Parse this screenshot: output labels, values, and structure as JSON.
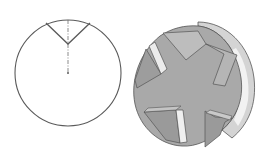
{
  "figure": {
    "colors": {
      "background": "#ffffff",
      "line": "#5a5a5a",
      "face": "#a9a9a9",
      "face_dark": "#8f8f8f",
      "rim_light": "#e6e6e6",
      "rim": "#c8c8c8",
      "slot_light": "#ececec",
      "outline": "#555555"
    },
    "views": [
      {
        "name": "section-view",
        "type": "2d-line-drawing"
      },
      {
        "name": "3d-view",
        "type": "shaded-solid",
        "flutes": 5
      }
    ]
  }
}
